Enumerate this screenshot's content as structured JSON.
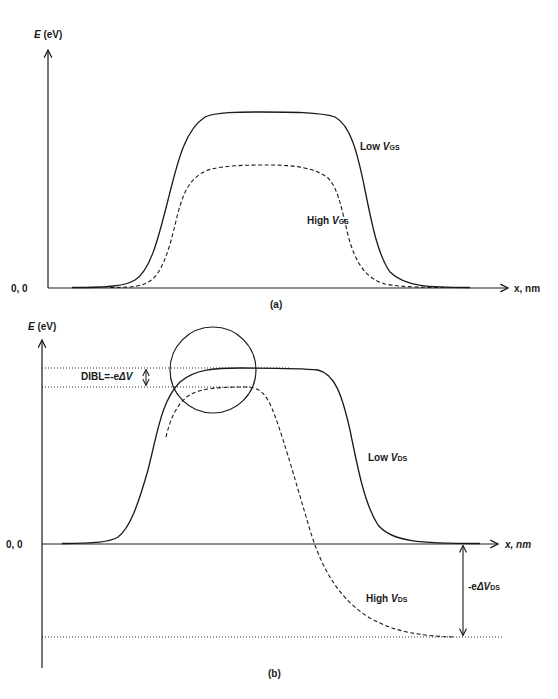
{
  "panel_a": {
    "caption": "(a)",
    "y_axis_label_var": "E",
    "y_axis_label_unit": " (eV)",
    "origin_label": "0, 0",
    "x_axis_label": "x, nm",
    "curves": [
      {
        "name": "Low V_GS",
        "label_main": "Low ",
        "label_var": "V",
        "label_sub": "GS",
        "style": "solid"
      },
      {
        "name": "High V_GS",
        "label_main": "High ",
        "label_var": "V",
        "label_sub": "GS",
        "style": "dashed"
      }
    ]
  },
  "panel_b": {
    "caption": "(b)",
    "y_axis_label_var": "E",
    "y_axis_label_unit": " (eV)",
    "origin_label": "0, 0",
    "x_axis_label": "x, nm",
    "dibl_label_main": "DIBL=-e",
    "dibl_label_delta": "ΔV",
    "drain_drop_label_main": "-e",
    "drain_drop_label_delta": "ΔV",
    "drain_drop_label_sub": "DS",
    "curves": [
      {
        "name": "Low V_DS",
        "label_main": "Low ",
        "label_var": "V",
        "label_sub": "DS",
        "style": "solid"
      },
      {
        "name": "High V_DS",
        "label_main": "High ",
        "label_var": "V",
        "label_sub": "DS",
        "style": "dashed"
      }
    ],
    "annotations": [
      "circle highlighting barrier lowering near source",
      "dotted reference lines at barrier peaks",
      "dotted reference line at drain level"
    ]
  },
  "colors": {
    "line": "#1a1a1a",
    "background": "#ffffff"
  }
}
